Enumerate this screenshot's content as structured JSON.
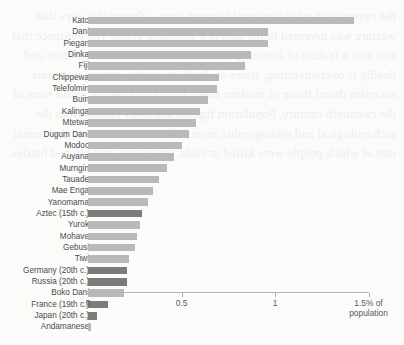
{
  "page": {
    "background_color": "#fbfbfa",
    "bleed_through_text": "the opposite of what you would expect from a theory that says that warfare was invented in the past few thousand years. The evidence that war was a feature of hunter-gatherer life and that it was common and deadly is overwhelming. Rates of death in warfare among non-state societies dwarf those of modern states even counting the world wars of the twentieth century. Population figures and body counts from the archaeological and ethnographic record allow us to estimate the annual rate at which people were killed in raids, ambushes, and pitched battles."
  },
  "chart_data": {
    "type": "bar",
    "orientation": "horizontal",
    "title": "",
    "subtitle": "",
    "xlabel": "",
    "ylabel": "",
    "xlim": [
      0,
      1.5
    ],
    "ticks": [
      {
        "value": 0,
        "label": "0"
      },
      {
        "value": 0.5,
        "label": "0.5"
      },
      {
        "value": 1,
        "label": "1"
      },
      {
        "value": 1.5,
        "label": "1.5"
      }
    ],
    "axis_unit_label_line1": "1.5% of",
    "axis_unit_label_line2": "population",
    "grid": false,
    "legend_position": "none",
    "colors": {
      "bar_light": "#b9b9b9",
      "bar_dark": "#7b7b7b",
      "axis": "#b4b4b4",
      "label_text": "#4b4b4b",
      "tick_text": "#5a5a5a"
    },
    "categories": [
      "Kato",
      "Dani",
      "Piegan",
      "Dinka",
      "Fiji",
      "Chippewa",
      "Telefolmin",
      "Buin",
      "Kalinga",
      "Mtetwa",
      "Dugum Dani",
      "Modoc",
      "Auyana",
      "Murngin",
      "Tauade",
      "Mae Enga",
      "Yanomama",
      "Aztec (15th c.)",
      "Yurok",
      "Mohave",
      "Gebusi",
      "Tiwi",
      "Germany (20th c.)",
      "Russia (20th c.)",
      "Boko Dani",
      "France (19th c.)",
      "Japan (20th c.)",
      "Andamanese"
    ],
    "values": [
      1.42,
      0.96,
      0.96,
      0.87,
      0.84,
      0.7,
      0.69,
      0.64,
      0.6,
      0.58,
      0.54,
      0.5,
      0.46,
      0.42,
      0.38,
      0.35,
      0.32,
      0.29,
      0.28,
      0.26,
      0.25,
      0.22,
      0.21,
      0.21,
      0.19,
      0.105,
      0.05,
      0.015
    ],
    "highlighted": [
      "Aztec (15th c.)",
      "Germany (20th c.)",
      "Russia (20th c.)",
      "France (19th c.)",
      "Japan (20th c.)"
    ]
  }
}
